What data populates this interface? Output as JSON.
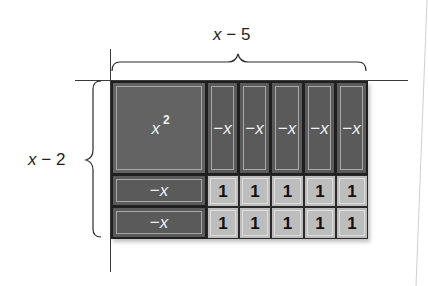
{
  "diagram": {
    "type": "algebra-tiles-area-model",
    "top_label": {
      "var": "x",
      "op": "−",
      "num": "5"
    },
    "left_label": {
      "var": "x",
      "op": "−",
      "num": "2"
    },
    "x_squared_tile": {
      "var": "x",
      "exponent": "2"
    },
    "negative_x_tile_label": {
      "minus": "−",
      "var": "x"
    },
    "unit_tile_label": "1",
    "vertical_neg_x_count": 5,
    "horizontal_neg_x_count": 2,
    "unit_rows": 2,
    "unit_cols": 5,
    "colors": {
      "dark_tile": "#5a5a5a",
      "light_tile": "#bdbdbd",
      "lines": "#3a3a3a",
      "background": "#ffffff"
    }
  }
}
